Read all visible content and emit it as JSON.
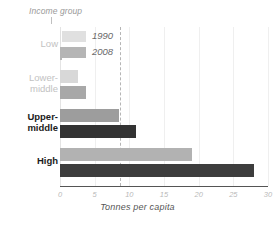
{
  "chart_data": {
    "type": "bar",
    "orientation": "horizontal",
    "title": "",
    "xlabel": "Tonnes per capita",
    "ylabel": "Income group",
    "categories": [
      "Low",
      "Lower-middle",
      "Upper-middle",
      "High"
    ],
    "xlim": [
      0,
      30
    ],
    "xticks": [
      0,
      5,
      10,
      15,
      20,
      25,
      30
    ],
    "xtick_labels": [
      "0",
      "5",
      "10",
      "15",
      "20",
      "25",
      "30"
    ],
    "grid": true,
    "legend_position": "top-left-inside",
    "series": [
      {
        "name": "1990",
        "color": "#c9c9c9",
        "values": [
          0.2,
          2.6,
          8.5,
          19.0
        ]
      },
      {
        "name": "2008",
        "color": "#8e8e8e",
        "values": [
          0.3,
          3.7,
          11.0,
          28.0
        ]
      }
    ],
    "annotations": [
      {
        "type": "reference-line",
        "orientation": "vertical",
        "value": 8.6,
        "style": "dashed"
      }
    ],
    "category_emphasis": [
      "muted",
      "muted",
      "strong",
      "strong"
    ],
    "bar_colors": {
      "Low": {
        "1990": "#e0e0e0",
        "2008": "#b5b5b5"
      },
      "Lower-middle": {
        "1990": "#d8d8d8",
        "2008": "#a8a8a8"
      },
      "Upper-middle": {
        "1990": "#9d9d9d",
        "2008": "#333333"
      },
      "High": {
        "1990": "#b2b2b2",
        "2008": "#3d3d3d"
      }
    }
  },
  "legend": {
    "items": [
      {
        "label": "1990",
        "color": "#e0e0e0"
      },
      {
        "label": "2008",
        "color": "#b5b5b5"
      }
    ]
  },
  "axis": {
    "y_caption": "Income group",
    "x_title": "Tonnes per capita"
  }
}
